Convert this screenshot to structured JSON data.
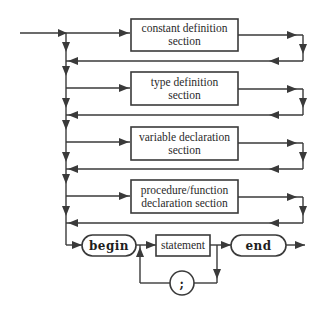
{
  "diagram": {
    "colors": {
      "line": "#3a3a3a",
      "background": "#ffffff",
      "text": "#2a2a2a"
    },
    "sections": [
      {
        "id": "constant",
        "line1": "constant definition",
        "line2": "section"
      },
      {
        "id": "type",
        "line1": "type definition",
        "line2": "section"
      },
      {
        "id": "variable",
        "line1": "variable declaration",
        "line2": "section"
      },
      {
        "id": "procedure",
        "line1": "procedure/function",
        "line2": "declaration section"
      }
    ],
    "body": {
      "begin": "begin",
      "statement": "statement",
      "separator": ";",
      "end": "end"
    }
  }
}
